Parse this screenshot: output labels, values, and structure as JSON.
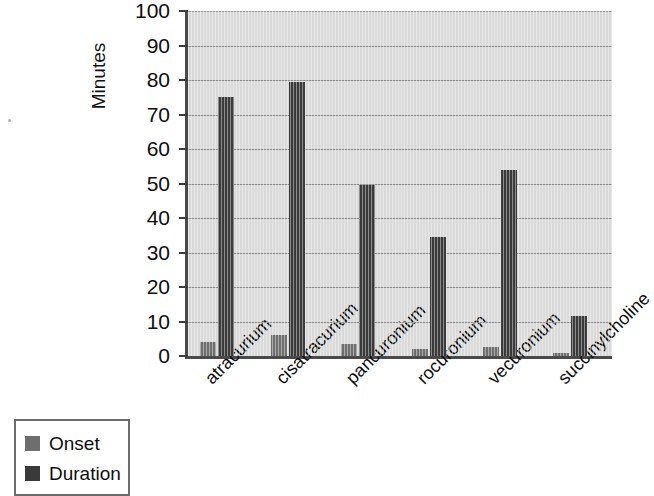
{
  "chart_data": {
    "type": "bar",
    "title": "",
    "subtitle": "",
    "xlabel": "",
    "ylabel": "Minutes",
    "ylim": [
      0,
      100
    ],
    "ytick_step": 10,
    "yticks": [
      "100",
      "90",
      "80",
      "70",
      "60",
      "50",
      "40",
      "30",
      "20",
      "10",
      "0"
    ],
    "grid": "horizontal",
    "legend_position": "bottom-left",
    "categories": [
      "atracurium",
      "cisatracurium",
      "pancuronium",
      "rocuronium",
      "vecuronium",
      "succinylcholine"
    ],
    "series": [
      {
        "name": "Onset",
        "color": "#6e6e6e",
        "values": [
          4,
          6,
          3.5,
          2,
          2.5,
          1
        ]
      },
      {
        "name": "Duration",
        "color": "#3a3a3a",
        "values": [
          75,
          79.5,
          49.5,
          34.5,
          54,
          11.5
        ]
      }
    ]
  },
  "legend": {
    "items": [
      {
        "label": "Onset",
        "color": "#6e6e6e"
      },
      {
        "label": "Duration",
        "color": "#3a3a3a"
      }
    ]
  },
  "colors": {
    "plot_background": "#d9d9d9",
    "gridline": "#8e8e8e",
    "axis": "#4a4a4a",
    "onset": "#6e6e6e",
    "duration": "#3a3a3a",
    "page_background": "#ffffff"
  }
}
